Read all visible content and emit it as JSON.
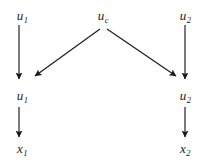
{
  "figure": {
    "type": "causal-dag",
    "background_color": "#ffffff",
    "stroke_color": "#1a1a1a",
    "width": 212,
    "height": 162
  },
  "nodes": [
    {
      "id": "u1-top",
      "base": "u",
      "subscript": "1",
      "x": 22,
      "y": 15,
      "row": "top"
    },
    {
      "id": "uc-top",
      "base": "u",
      "subscript": "c",
      "x": 103,
      "y": 15,
      "row": "top"
    },
    {
      "id": "u2-top",
      "base": "u",
      "subscript": "2",
      "x": 185,
      "y": 15,
      "row": "top"
    },
    {
      "id": "u1-mid",
      "base": "u",
      "subscript": "1",
      "x": 22,
      "y": 95,
      "row": "middle"
    },
    {
      "id": "u2-mid",
      "base": "u",
      "subscript": "2",
      "x": 185,
      "y": 95,
      "row": "middle"
    },
    {
      "id": "x1-bottom",
      "base": "x",
      "subscript": "1",
      "x": 22,
      "y": 148,
      "row": "bottom"
    },
    {
      "id": "x2-bottom",
      "base": "x",
      "subscript": "2",
      "x": 185,
      "y": 148,
      "row": "bottom"
    }
  ],
  "edges": [
    {
      "id": "edge-u1top-u1mid",
      "from": "u1-top",
      "to": "u1-mid",
      "x1": 19,
      "y1": 25,
      "x2": 19,
      "y2": 79,
      "kind": "vertical"
    },
    {
      "id": "edge-u2top-u2mid",
      "from": "u2-top",
      "to": "u2-mid",
      "x1": 185,
      "y1": 25,
      "x2": 185,
      "y2": 79,
      "kind": "vertical"
    },
    {
      "id": "edge-uc-u1mid",
      "from": "uc-top",
      "to": "u1-mid",
      "x1": 100,
      "y1": 29,
      "x2": 35,
      "y2": 76,
      "kind": "diagonal-left"
    },
    {
      "id": "edge-uc-u2mid",
      "from": "uc-top",
      "to": "u2-mid",
      "x1": 107,
      "y1": 29,
      "x2": 176,
      "y2": 76,
      "kind": "diagonal-right"
    },
    {
      "id": "edge-u1mid-x1",
      "from": "u1-mid",
      "to": "x1-bottom",
      "x1": 19,
      "y1": 107,
      "x2": 19,
      "y2": 137,
      "kind": "vertical"
    },
    {
      "id": "edge-u2mid-x2",
      "from": "u2-mid",
      "to": "x2-bottom",
      "x1": 185,
      "y1": 107,
      "x2": 185,
      "y2": 137,
      "kind": "vertical"
    }
  ],
  "labels": {
    "u1_top": "u",
    "u1_top_sub": "1",
    "uc_top": "u",
    "uc_top_sub": "c",
    "u2_top": "u",
    "u2_top_sub": "2",
    "u1_mid": "u",
    "u1_mid_sub": "1",
    "u2_mid": "u",
    "u2_mid_sub": "2",
    "x1_bottom": "x",
    "x1_bottom_sub": "1",
    "x2_bottom": "x",
    "x2_bottom_sub": "2"
  }
}
